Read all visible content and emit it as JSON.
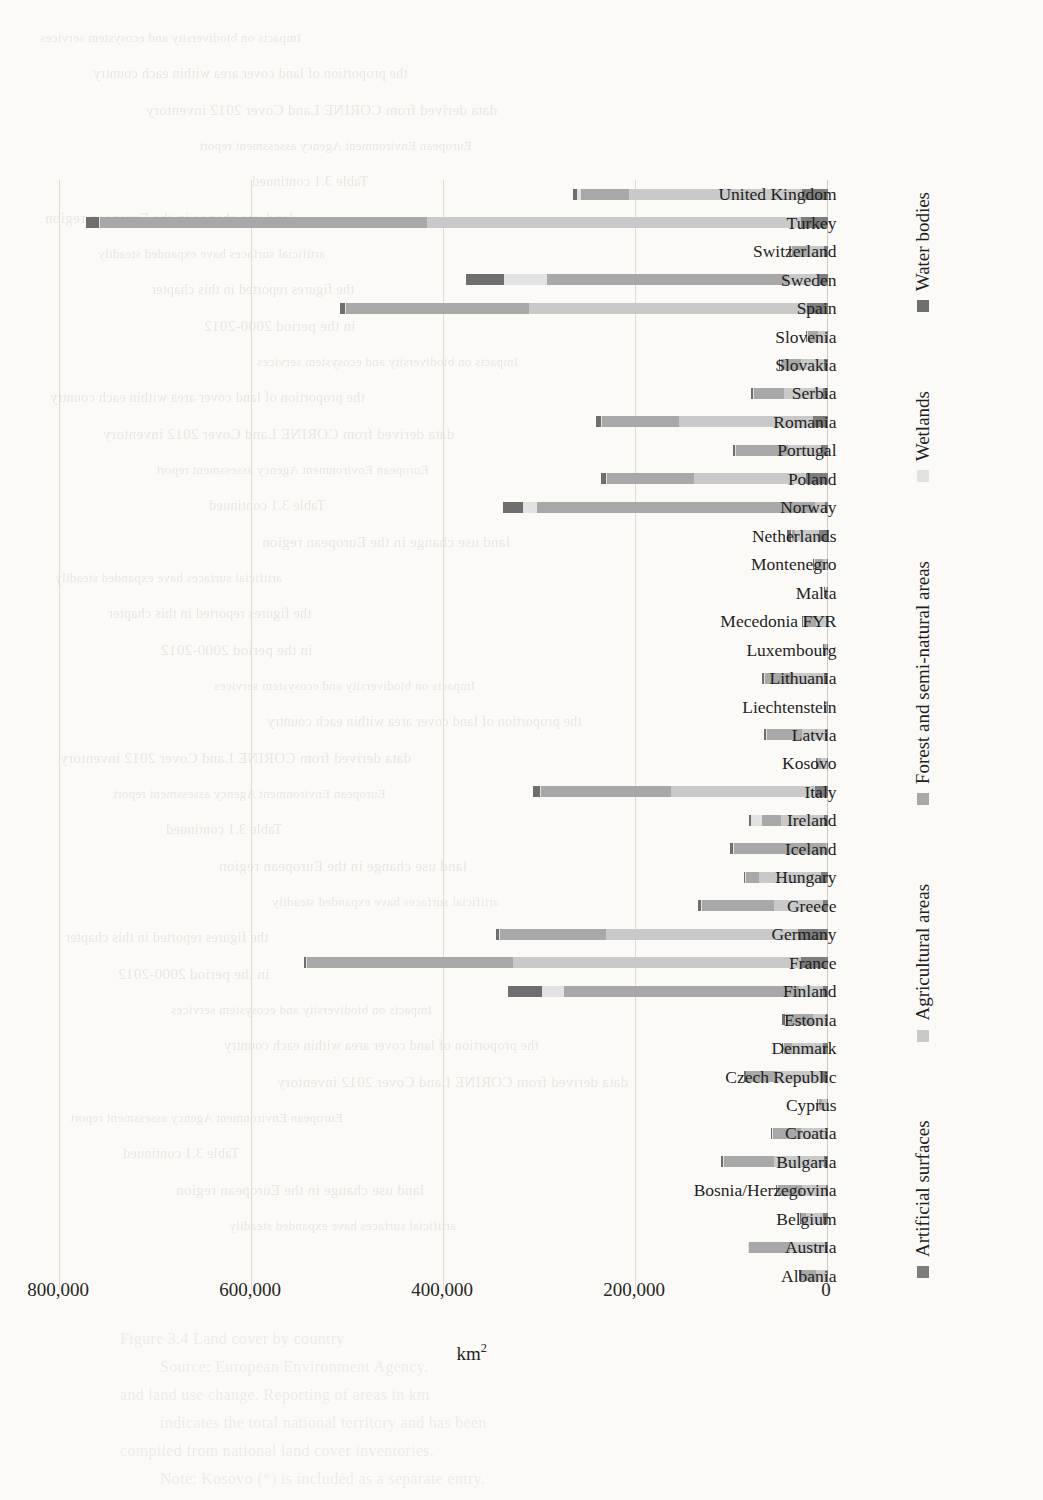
{
  "page": {
    "background_color": "#fbfaf7",
    "bleed_through_lines": [
      "Impacts on biodiversity and ecosystem services",
      "the proportion of land cover area within each country",
      "data derived from CORINE Land Cover 2012 inventory",
      "European Environment Agency assessment report",
      "Table 3.1 continued",
      "land use change in the European region",
      "artificial surfaces have expanded steadily",
      "the figures reported in this chapter",
      "in the period 2000-2012"
    ],
    "bleed_bottom_lines": [
      "Figure 3.4  Land cover by country",
      "Source: European Environment Agency.",
      "and land use change. Reporting of areas in km",
      "indicates the total national territory and has been",
      "compiled from national land cover inventories.",
      "Note: Kosovo (*) is included as a separate entry."
    ]
  },
  "chart_data": {
    "type": "bar",
    "orientation": "vertical-rotated",
    "title": "",
    "xlabel": "",
    "ylabel": "km²",
    "ylim": [
      0,
      800000
    ],
    "yticks": [
      0,
      200000,
      400000,
      600000,
      800000
    ],
    "ytick_labels": [
      "0",
      "200,000",
      "400,000",
      "600,000",
      "800,000"
    ],
    "grid": true,
    "stacked": true,
    "legend_position": "bottom",
    "legend": [
      {
        "name": "Artificial surfaces",
        "color": "#7d7d7d"
      },
      {
        "name": "Agricultural areas",
        "color": "#c9c9c9"
      },
      {
        "name": "Forest and semi-natural areas",
        "color": "#a8a8a8"
      },
      {
        "name": "Wetlands",
        "color": "#e2e2e2"
      },
      {
        "name": "Water bodies",
        "color": "#6e6e6e"
      }
    ],
    "categories": [
      "Albania",
      "Austria",
      "Belgium",
      "Bosnia/Herzegovina",
      "Bulgaria",
      "Croatia",
      "Cyprus",
      "Czech Republic",
      "Denmark",
      "Estonia",
      "Finland",
      "France",
      "Germany",
      "Greece",
      "Hungary",
      "Iceland",
      "Ireland",
      "Italy",
      "Kosovo",
      "Latvia",
      "Liechtenstein",
      "Lithuania",
      "Luxembourg",
      "Mecedonia FYR",
      "Malta",
      "Montenegro",
      "Netherlands",
      "Norway",
      "Poland",
      "Portugal",
      "Romania",
      "Serbia",
      "Slovakia",
      "Slovenia",
      "Spain",
      "Sweden",
      "Switzerland",
      "Turkey",
      "United Kingdom"
    ],
    "series": [
      {
        "name": "Artificial surfaces",
        "color": "#7d7d7d",
        "values": [
          900,
          3100,
          5200,
          2300,
          4600,
          2600,
          900,
          7100,
          5300,
          2400,
          5200,
          28000,
          31500,
          4800,
          7500,
          500,
          4200,
          13800,
          1000,
          3000,
          100,
          4000,
          500,
          2000,
          80,
          400,
          9500,
          2700,
          23000,
          6800,
          15500,
          5600,
          4500,
          1500,
          22000,
          9500,
          4000,
          28000,
          27000
        ]
      },
      {
        "name": "Agricultural areas",
        "color": "#c9c9c9",
        "values": [
          12000,
          37000,
          17500,
          25000,
          52000,
          26000,
          5500,
          46000,
          32500,
          13500,
          25000,
          300000,
          200000,
          52000,
          64000,
          1700,
          44500,
          150000,
          6500,
          24000,
          60,
          33000,
          1600,
          11000,
          120,
          4000,
          24500,
          10500,
          117000,
          35000,
          140000,
          40000,
          24000,
          8500,
          290000,
          33000,
          16000,
          390000,
          180000
        ]
      },
      {
        "name": "Forest and semi-natural areas",
        "color": "#a8a8a8",
        "values": [
          15000,
          42000,
          5000,
          25000,
          52000,
          29000,
          3500,
          32000,
          8000,
          27500,
          245000,
          215000,
          110000,
          75000,
          14000,
          95000,
          20500,
          135000,
          3500,
          36500,
          100,
          28500,
          1400,
          12500,
          110,
          9000,
          3500,
          290000,
          90000,
          54000,
          80000,
          32000,
          21000,
          11000,
          190000,
          250000,
          18000,
          340000,
          50000
        ]
      },
      {
        "name": "Wetlands",
        "color": "#e2e2e2",
        "values": [
          400,
          100,
          300,
          100,
          400,
          300,
          60,
          200,
          1200,
          1500,
          23000,
          1000,
          1200,
          700,
          400,
          1500,
          11500,
          400,
          60,
          900,
          10,
          1000,
          40,
          60,
          10,
          60,
          1000,
          15000,
          1500,
          500,
          1200,
          300,
          300,
          100,
          800,
          45000,
          200,
          900,
          4000
        ]
      },
      {
        "name": "Water bodies",
        "color": "#6e6e6e",
        "values": [
          1400,
          600,
          600,
          400,
          1800,
          600,
          100,
          1600,
          700,
          3000,
          35000,
          2000,
          3500,
          2500,
          1500,
          3000,
          1500,
          7500,
          200,
          2500,
          20,
          2600,
          80,
          500,
          10,
          400,
          4500,
          20000,
          5500,
          2500,
          5500,
          1500,
          900,
          200,
          5500,
          40000,
          1500,
          14000,
          4500
        ]
      }
    ]
  }
}
